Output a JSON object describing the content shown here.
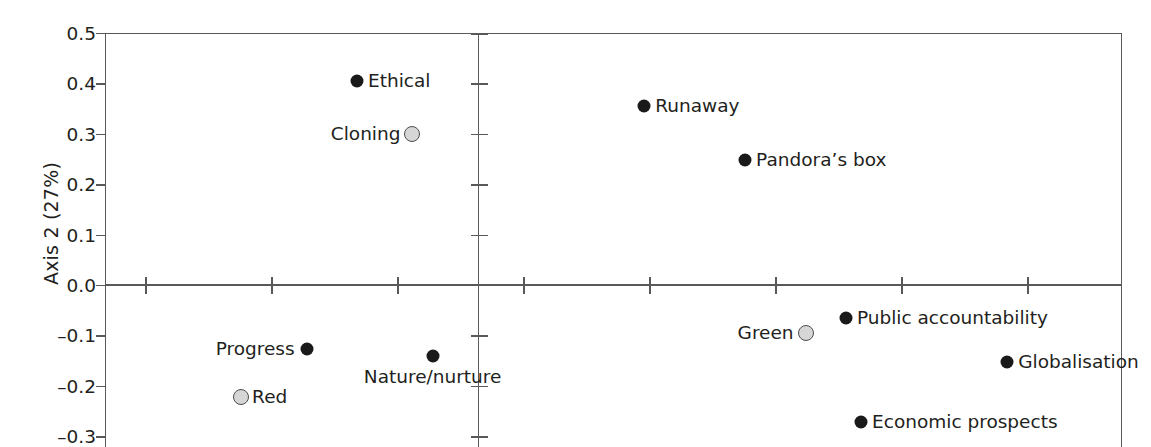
{
  "chart_data": {
    "type": "scatter",
    "title": "",
    "xlabel": "",
    "ylabel": "Axis 2 (27%)",
    "ylim": [
      -0.33,
      0.5
    ],
    "xlim": [
      -1.0,
      1.72
    ],
    "grid": false,
    "legend": null,
    "y_ticks": [
      "0.5",
      "0.4",
      "0.3",
      "0.2",
      "0.1",
      "0.0",
      "–0.1",
      "–0.2",
      "–0.3"
    ],
    "y_tick_values": [
      0.5,
      0.4,
      0.3,
      0.2,
      0.1,
      0.0,
      -0.1,
      -0.2,
      -0.3
    ],
    "x_tick_values": [
      -0.66,
      -0.41,
      -0.16,
      0.09,
      0.34,
      0.59,
      0.84,
      1.09,
      1.34
    ],
    "points": [
      {
        "label": "Ethical",
        "x": -0.24,
        "y": 0.405,
        "marker": "filled",
        "label_pos": "right"
      },
      {
        "label": "Cloning",
        "x": -0.13,
        "y": 0.3,
        "marker": "open",
        "label_pos": "left"
      },
      {
        "label": "Runaway",
        "x": 0.33,
        "y": 0.356,
        "marker": "filled",
        "label_pos": "right"
      },
      {
        "label": "Pandora’s box",
        "x": 0.53,
        "y": 0.248,
        "marker": "filled",
        "label_pos": "right"
      },
      {
        "label": "Public accountability",
        "x": 0.73,
        "y": -0.065,
        "marker": "filled",
        "label_pos": "right"
      },
      {
        "label": "Green",
        "x": 0.65,
        "y": -0.095,
        "marker": "open",
        "label_pos": "left"
      },
      {
        "label": "Globalisation",
        "x": 1.05,
        "y": -0.152,
        "marker": "filled",
        "label_pos": "right"
      },
      {
        "label": "Economic prospects",
        "x": 0.76,
        "y": -0.272,
        "marker": "filled",
        "label_pos": "right"
      },
      {
        "label": "Progress",
        "x": -0.34,
        "y": -0.127,
        "marker": "filled",
        "label_pos": "left"
      },
      {
        "label": "Nature/nurture",
        "x": -0.09,
        "y": -0.141,
        "marker": "filled",
        "label_pos": "below"
      },
      {
        "label": "Red",
        "x": -0.47,
        "y": -0.222,
        "marker": "open",
        "label_pos": "right"
      }
    ]
  }
}
